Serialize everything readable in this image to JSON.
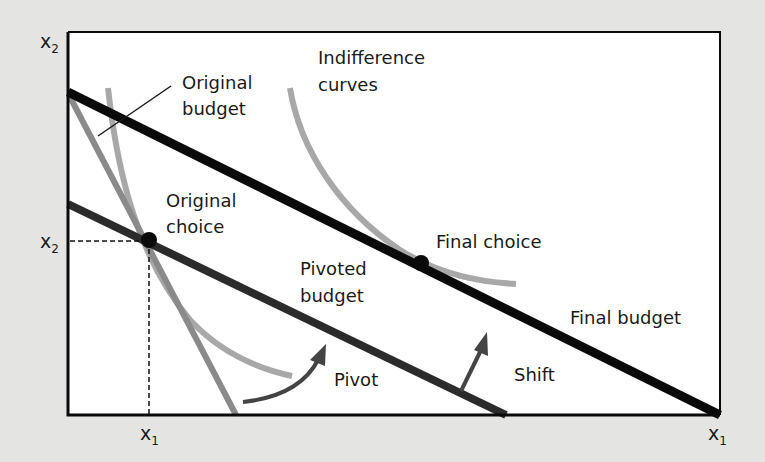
{
  "diagram": {
    "title": "",
    "axes": {
      "y_axis_label": "x",
      "y_axis_sub": "2",
      "x_axis_label": "x",
      "x_axis_sub": "1",
      "y_tick_label": "x",
      "y_tick_sub": "2",
      "x_tick_label": "x",
      "x_tick_sub": "1"
    },
    "labels": {
      "original_budget_line1": "Original",
      "original_budget_line2": "budget",
      "indifference_line1": "Indifference",
      "indifference_line2": "curves",
      "original_choice_line1": "Original",
      "original_choice_line2": "choice",
      "final_choice": "Final choice",
      "pivoted_budget_line1": "Pivoted",
      "pivoted_budget_line2": "budget",
      "final_budget": "Final budget",
      "pivot": "Pivot",
      "shift": "Shift"
    },
    "colors": {
      "background": "#e4e4e2",
      "plot_area": "#ffffff",
      "budget_line": "#0a0a0a",
      "pivoted_line": "#2b2b2b",
      "original_budget": "#8a8a8a",
      "indifference_curve": "#a8a8a8",
      "arrow": "#444444"
    }
  }
}
